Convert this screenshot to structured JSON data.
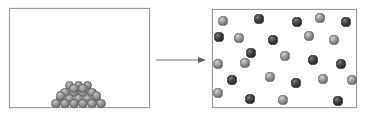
{
  "figure": {
    "type": "phase-change-diagram",
    "background_color": "#ffffff",
    "border_color": "#9a9a9a"
  },
  "left_panel": {
    "name": "solid-state-container",
    "x": 9,
    "y": 8,
    "width": 141,
    "height": 100,
    "particle_count": 22,
    "particle_arrangement": "close-packed pile resting on container floor",
    "particle_color": "#8b8b8b",
    "particle_radius_px": 4.6,
    "particles": [
      {
        "cx": 69.5,
        "cy": 85.5,
        "shade": "pile"
      },
      {
        "cx": 78.5,
        "cy": 85.5,
        "shade": "pile"
      },
      {
        "cx": 87.5,
        "cy": 85.5,
        "shade": "pile"
      },
      {
        "cx": 65.0,
        "cy": 92.5,
        "shade": "pile"
      },
      {
        "cx": 74.0,
        "cy": 92.5,
        "shade": "pile"
      },
      {
        "cx": 83.0,
        "cy": 92.5,
        "shade": "pile"
      },
      {
        "cx": 92.0,
        "cy": 92.5,
        "shade": "pile"
      },
      {
        "cx": 60.5,
        "cy": 99.0,
        "shade": "pile"
      },
      {
        "cx": 69.5,
        "cy": 99.0,
        "shade": "pile"
      },
      {
        "cx": 78.5,
        "cy": 99.0,
        "shade": "pile"
      },
      {
        "cx": 87.5,
        "cy": 99.0,
        "shade": "pile"
      },
      {
        "cx": 96.5,
        "cy": 99.0,
        "shade": "pile"
      },
      {
        "cx": 56.0,
        "cy": 103.5,
        "shade": "pile"
      },
      {
        "cx": 65.0,
        "cy": 103.5,
        "shade": "pile"
      },
      {
        "cx": 74.0,
        "cy": 103.5,
        "shade": "pile"
      },
      {
        "cx": 83.0,
        "cy": 103.5,
        "shade": "pile"
      },
      {
        "cx": 92.0,
        "cy": 103.5,
        "shade": "pile"
      },
      {
        "cx": 101.0,
        "cy": 103.5,
        "shade": "pile"
      },
      {
        "cx": 60.5,
        "cy": 96.0,
        "shade": "pile"
      },
      {
        "cx": 96.5,
        "cy": 96.0,
        "shade": "pile"
      },
      {
        "cx": 74.0,
        "cy": 88.5,
        "shade": "pile"
      },
      {
        "cx": 83.0,
        "cy": 88.5,
        "shade": "pile"
      }
    ]
  },
  "arrow": {
    "name": "transition-arrow",
    "direction": "right",
    "color": "#6f6f6f",
    "x_start": 157,
    "x_end": 206,
    "y": 60
  },
  "right_panel": {
    "name": "gas-state-container",
    "x": 212,
    "y": 9,
    "width": 145,
    "height": 99,
    "particle_count": 25,
    "particle_arrangement": "randomly dispersed, filling the container",
    "particle_colors": {
      "light": "#8f8f8f",
      "dark": "#3d3d3d"
    },
    "particle_radius_px": 4.6,
    "particles": [
      {
        "cx": 223.0,
        "cy": 21.0,
        "shade": "light"
      },
      {
        "cx": 259.0,
        "cy": 19.0,
        "shade": "dark"
      },
      {
        "cx": 297.0,
        "cy": 22.0,
        "shade": "dark"
      },
      {
        "cx": 320.0,
        "cy": 18.0,
        "shade": "light"
      },
      {
        "cx": 346.0,
        "cy": 22.0,
        "shade": "dark"
      },
      {
        "cx": 239.0,
        "cy": 38.0,
        "shade": "light"
      },
      {
        "cx": 273.0,
        "cy": 40.0,
        "shade": "dark"
      },
      {
        "cx": 309.0,
        "cy": 36.0,
        "shade": "light"
      },
      {
        "cx": 334.0,
        "cy": 40.0,
        "shade": "light"
      },
      {
        "cx": 219.0,
        "cy": 37.0,
        "shade": "dark"
      },
      {
        "cx": 251.0,
        "cy": 53.0,
        "shade": "dark"
      },
      {
        "cx": 285.0,
        "cy": 56.0,
        "shade": "light"
      },
      {
        "cx": 218.0,
        "cy": 64.0,
        "shade": "light"
      },
      {
        "cx": 245.0,
        "cy": 63.0,
        "shade": "light"
      },
      {
        "cx": 313.0,
        "cy": 60.0,
        "shade": "dark"
      },
      {
        "cx": 341.0,
        "cy": 64.0,
        "shade": "dark"
      },
      {
        "cx": 270.0,
        "cy": 77.0,
        "shade": "light"
      },
      {
        "cx": 232.0,
        "cy": 80.0,
        "shade": "dark"
      },
      {
        "cx": 296.0,
        "cy": 83.0,
        "shade": "dark"
      },
      {
        "cx": 323.0,
        "cy": 79.0,
        "shade": "light"
      },
      {
        "cx": 352.0,
        "cy": 80.0,
        "shade": "light"
      },
      {
        "cx": 218.0,
        "cy": 93.0,
        "shade": "light"
      },
      {
        "cx": 250.0,
        "cy": 99.0,
        "shade": "dark"
      },
      {
        "cx": 283.0,
        "cy": 100.0,
        "shade": "light"
      },
      {
        "cx": 338.0,
        "cy": 101.0,
        "shade": "dark"
      }
    ]
  }
}
